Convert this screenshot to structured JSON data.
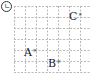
{
  "problem_label": "ㄴ",
  "grid": {
    "cols": 7,
    "rows": 6,
    "cell_px": 11,
    "line_color": "#b8b8b8"
  },
  "points": [
    {
      "name": "A",
      "marker": "*",
      "col": 2,
      "row": 4
    },
    {
      "name": "B",
      "marker": "*",
      "col": 4,
      "row": 5
    },
    {
      "name": "C",
      "marker": "*",
      "col": 6,
      "row": 1
    }
  ],
  "labels": {
    "point_a": "A",
    "point_b": "B",
    "point_c": "C",
    "marker": "*"
  }
}
